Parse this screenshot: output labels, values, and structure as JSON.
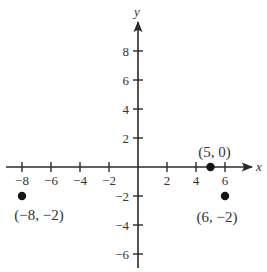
{
  "chart_data": {
    "type": "scatter",
    "title": "",
    "xlabel": "x",
    "ylabel": "y",
    "xlim": [
      -9,
      8
    ],
    "ylim": [
      -7,
      10
    ],
    "grid": false,
    "x_ticks": [
      -8,
      -6,
      -4,
      -2,
      2,
      4,
      6
    ],
    "y_ticks": [
      8,
      6,
      4,
      2,
      -2,
      -4,
      -6
    ],
    "x_tick_labels": [
      "−8",
      "−6",
      "−4",
      "−2",
      "2",
      "4",
      "6"
    ],
    "y_tick_labels": [
      "8",
      "6",
      "4",
      "2",
      "−2",
      "−4",
      "−6"
    ],
    "points": [
      {
        "x": -8,
        "y": -2,
        "label": "(−8, −2)"
      },
      {
        "x": 5,
        "y": 0,
        "label": "(5, 0)"
      },
      {
        "x": 6,
        "y": -2,
        "label": "(6, −2)"
      }
    ]
  }
}
